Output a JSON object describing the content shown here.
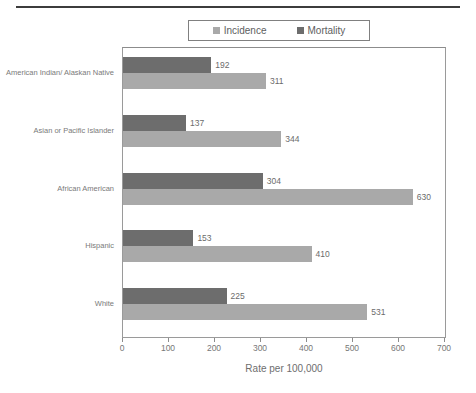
{
  "chart_data": {
    "type": "bar",
    "orientation": "horizontal",
    "title": "",
    "xlabel": "Rate per 100,000",
    "ylabel": "",
    "xlim": [
      0,
      700
    ],
    "xticks": [
      0,
      100,
      200,
      300,
      400,
      500,
      600,
      700
    ],
    "grid": false,
    "legend_position": "top",
    "categories": [
      "American Indian/ Alaskan Native",
      "Asian or Pacific Islander",
      "African American",
      "Hispanic",
      "White"
    ],
    "series": [
      {
        "name": "Mortality",
        "color": "#6d6d6d",
        "values": [
          192,
          137,
          304,
          153,
          225
        ]
      },
      {
        "name": "Incidence",
        "color": "#a9a9a9",
        "values": [
          311,
          344,
          630,
          410,
          531
        ]
      }
    ]
  },
  "legend": {
    "items": [
      {
        "label": "Incidence",
        "color": "#a9a9a9"
      },
      {
        "label": "Mortality",
        "color": "#6d6d6d"
      }
    ]
  },
  "axis": {
    "x_title": "Rate per 100,000",
    "x_tick_labels": [
      "0",
      "100",
      "200",
      "300",
      "400",
      "500",
      "600",
      "700"
    ]
  }
}
